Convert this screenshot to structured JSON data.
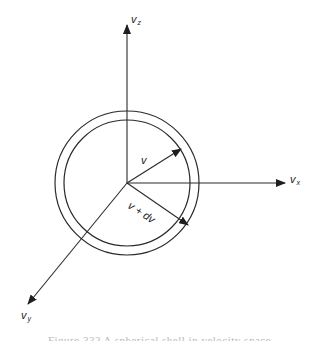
{
  "diagram": {
    "type": "velocity-space-shell",
    "colors": {
      "stroke": "#2a2a2a",
      "background": "#ffffff",
      "caption": "#b8b8b8"
    },
    "origin": {
      "x": 127,
      "y": 183
    },
    "shell": {
      "inner_radius": 63,
      "outer_radius": 72
    },
    "axes": [
      {
        "id": "vz",
        "label": "v",
        "subscript": "z",
        "direction": "up"
      },
      {
        "id": "vx",
        "label": "v",
        "subscript": "x",
        "direction": "right"
      },
      {
        "id": "vy",
        "label": "v",
        "subscript": "y",
        "direction": "down-left"
      }
    ],
    "vectors": [
      {
        "id": "v",
        "label": "v",
        "ends_on": "inner-circle"
      },
      {
        "id": "v_plus_dv",
        "label": "v + dv",
        "ends_on": "outer-circle"
      }
    ],
    "caption": "Figure 332  A spherical shell in velocity space"
  }
}
